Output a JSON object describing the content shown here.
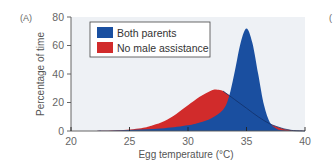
{
  "panel_label": "(A)",
  "next_panel_label": "(",
  "chart_data": {
    "type": "area",
    "title": "",
    "xlabel": "Egg temperature (°C)",
    "ylabel": "Percentage of time",
    "xlim": [
      20,
      40
    ],
    "ylim": [
      0,
      80
    ],
    "xticks": [
      20,
      25,
      30,
      35,
      40
    ],
    "yticks": [
      0,
      20,
      40,
      60,
      80
    ],
    "grid": false,
    "legend_position": "upper left",
    "series": [
      {
        "name": "Both parents",
        "color": "#1a4fa0",
        "x": [
          22,
          24,
          26,
          28,
          30,
          31,
          32,
          33,
          33.5,
          34,
          34.5,
          35,
          35.5,
          36,
          36.5,
          37,
          37.5,
          38,
          39,
          40
        ],
        "values": [
          0,
          0.3,
          1,
          2,
          4,
          6,
          9,
          15,
          24,
          42,
          62,
          72,
          62,
          40,
          18,
          6,
          2,
          0.5,
          0.1,
          0
        ]
      },
      {
        "name": "No male assistance",
        "color": "#d12b2b",
        "x": [
          22,
          24,
          26,
          27,
          28,
          29,
          30,
          31,
          32,
          32.5,
          33,
          34,
          35,
          36,
          37,
          38,
          38.5,
          39,
          40
        ],
        "values": [
          0,
          0.5,
          2,
          4,
          7,
          12,
          18,
          24,
          28.5,
          29,
          28,
          22,
          16,
          10,
          5,
          2,
          1,
          0.3,
          0
        ]
      }
    ]
  },
  "legend": {
    "items": [
      {
        "label": "Both parents",
        "color": "#1a4fa0"
      },
      {
        "label": "No male assistance",
        "color": "#d12b2b"
      }
    ]
  },
  "colors": {
    "plot_background": "#eef1f5",
    "axis": "#555555"
  }
}
